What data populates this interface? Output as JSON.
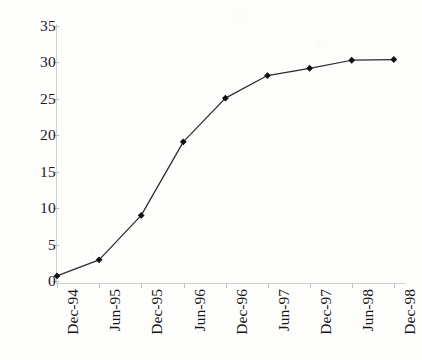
{
  "chart_data": {
    "type": "line",
    "title": "",
    "subtitle": "",
    "xlabel": "",
    "ylabel": "",
    "categories": [
      "Dec-94",
      "Jun-95",
      "Dec-95",
      "Jun-96",
      "Dec-96",
      "Jun-97",
      "Dec-97",
      "Jun-98",
      "Dec-98"
    ],
    "values": [
      0.7,
      2.9,
      9.0,
      19.1,
      25.1,
      28.2,
      29.2,
      30.3,
      30.4
    ],
    "series": [
      {
        "name": "",
        "values": [
          0.7,
          2.9,
          9.0,
          19.1,
          25.1,
          28.2,
          29.2,
          30.3,
          30.4
        ]
      }
    ],
    "ylim": [
      0,
      35
    ],
    "yticks": [
      0,
      5,
      10,
      15,
      20,
      25,
      30,
      35
    ],
    "ytick_labels": [
      "0",
      "5",
      "10",
      "15",
      "20",
      "25",
      "30",
      "35"
    ],
    "xtick_labels": [
      "Dec-94",
      "Jun-95",
      "Dec-95",
      "Jun-96",
      "Dec-96",
      "Jun-97",
      "Dec-97",
      "Jun-98",
      "Dec-98"
    ],
    "grid": false,
    "legend": null,
    "legend_position": "none",
    "annotations": [],
    "marker": "diamond",
    "line_color": "#2b2b2b",
    "marker_color": "#111111",
    "axis_color": "#d0d0d0",
    "background_color": "#fdfdfc",
    "xlabel_rotation": -90
  }
}
